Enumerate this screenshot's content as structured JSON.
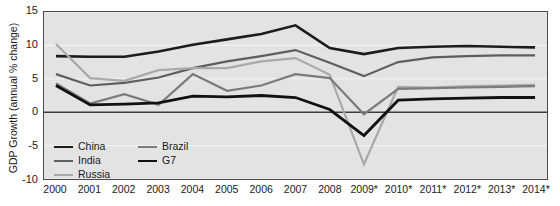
{
  "figure": {
    "title_partial": "",
    "y_axis_title": "GDP Growth (annual % change)"
  },
  "legend": {
    "column1": [
      {
        "label": "China",
        "color": "#1c1c1c",
        "width": 2.6
      },
      {
        "label": "India",
        "color": "#5e5e5e",
        "width": 2.2
      },
      {
        "label": "Russia",
        "color": "#a9a9a9",
        "width": 2.2
      }
    ],
    "column2": [
      {
        "label": "Brazil",
        "color": "#7b7b7b",
        "width": 2.2
      },
      {
        "label": "G7",
        "color": "#111111",
        "width": 2.8
      }
    ]
  },
  "chart_data": {
    "type": "line",
    "title": "",
    "xlabel": "",
    "ylabel": "GDP Growth (annual % change)",
    "ylim": [
      -10,
      15
    ],
    "yticks": [
      15,
      10,
      5,
      0,
      -5,
      -10
    ],
    "grid": true,
    "legend_position": "bottom-left-inside",
    "note": "Years marked with * are forecasts",
    "categories": [
      "2000",
      "2001",
      "2002",
      "2003",
      "2004",
      "2005",
      "2006",
      "2007",
      "2008",
      "2009*",
      "2010*",
      "2011*",
      "2012*",
      "2013*",
      "2014*"
    ],
    "x": [
      "2000",
      "2001",
      "2002",
      "2003",
      "2004",
      "2005",
      "2006",
      "2007",
      "2008",
      "2009*",
      "2010*",
      "2011*",
      "2012*",
      "2013*",
      "2014*"
    ],
    "series": [
      {
        "name": "China",
        "color": "#1c1c1c",
        "width": 2.6,
        "values": [
          8.4,
          8.3,
          8.3,
          9.1,
          10.1,
          10.9,
          11.7,
          13.0,
          9.6,
          8.7,
          9.6,
          9.8,
          9.9,
          9.8,
          9.7
        ]
      },
      {
        "name": "India",
        "color": "#5e5e5e",
        "width": 2.2,
        "values": [
          5.7,
          4.0,
          4.4,
          5.2,
          6.6,
          7.6,
          8.4,
          9.3,
          7.4,
          5.4,
          7.5,
          8.2,
          8.4,
          8.5,
          8.5
        ]
      },
      {
        "name": "Russia",
        "color": "#a9a9a9",
        "width": 2.2,
        "values": [
          10.2,
          5.1,
          4.7,
          6.3,
          6.6,
          6.6,
          7.6,
          8.1,
          5.6,
          -7.8,
          3.8,
          3.7,
          3.9,
          4.0,
          4.1
        ]
      },
      {
        "name": "Brazil",
        "color": "#7b7b7b",
        "width": 2.2,
        "values": [
          4.3,
          1.3,
          2.7,
          1.1,
          5.7,
          3.2,
          4.0,
          5.7,
          5.1,
          -0.3,
          3.5,
          3.6,
          3.7,
          3.8,
          3.9
        ]
      },
      {
        "name": "G7",
        "color": "#111111",
        "width": 2.8,
        "values": [
          4.0,
          1.1,
          1.2,
          1.4,
          2.4,
          2.3,
          2.5,
          2.2,
          0.4,
          -3.5,
          1.8,
          2.0,
          2.1,
          2.2,
          2.2
        ]
      }
    ]
  }
}
